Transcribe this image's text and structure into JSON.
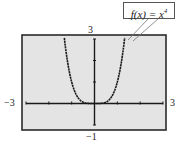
{
  "chart_data": {
    "type": "line",
    "title": "",
    "function": "f(x) = x^4",
    "series": [
      {
        "name": "f(x) = x^4",
        "x": [
          -1.32,
          -1.2,
          -1.0,
          -0.8,
          -0.6,
          -0.4,
          -0.2,
          0,
          0.2,
          0.4,
          0.6,
          0.8,
          1.0,
          1.2,
          1.32
        ],
        "y": [
          3.04,
          2.07,
          1.0,
          0.41,
          0.13,
          0.026,
          0.0016,
          0,
          0.0016,
          0.026,
          0.13,
          0.41,
          1.0,
          2.07,
          3.04
        ]
      }
    ],
    "xlim": [
      -3,
      3
    ],
    "ylim": [
      -1,
      3
    ],
    "xticks": [
      -3,
      -2,
      -1,
      0,
      1,
      2,
      3
    ],
    "yticks": [
      -1,
      0,
      1,
      2,
      3
    ],
    "xlabel": "",
    "ylabel": "",
    "grid": false,
    "annotations": [
      "f(x) = x^4"
    ],
    "window_labels": {
      "xmin": "−3",
      "xmax": "3",
      "ymin": "−1",
      "ymax": "3"
    }
  },
  "labels": {
    "xmin": "−3",
    "xmax": "3",
    "ymin": "−1",
    "ymax": "3",
    "callout_base": "f(x) = x",
    "callout_exp": "4"
  },
  "colors": {
    "screen_bg": "#e4e4e4",
    "frame": "#2a2a2a",
    "curve": "#1a1a1a"
  }
}
